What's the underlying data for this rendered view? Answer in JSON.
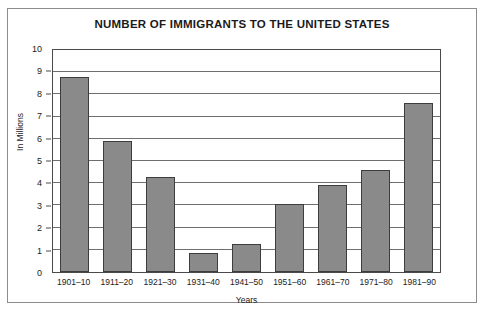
{
  "chart_data": {
    "type": "bar",
    "title": "NUMBER OF IMMIGRANTS TO THE UNITED STATES",
    "xlabel": "Years",
    "ylabel": "In Millions",
    "categories": [
      "1901–10",
      "1911–20",
      "1921–30",
      "1931–40",
      "1941–50",
      "1951–60",
      "1961–70",
      "1971–80",
      "1981–90"
    ],
    "values": [
      8.8,
      5.9,
      4.3,
      0.85,
      1.25,
      3.05,
      3.9,
      4.6,
      7.6
    ],
    "ylim": [
      0,
      10
    ],
    "ytick_labels": [
      "10",
      "9",
      "8",
      "7",
      "6",
      "5",
      "4",
      "3",
      "2",
      "1",
      "0"
    ],
    "ytick_values": [
      10,
      9,
      8,
      7,
      6,
      5,
      4,
      3,
      2,
      1,
      0
    ],
    "grid": true,
    "legend": null,
    "bar_color": "#8a8a8a",
    "bar_border_color": "#3d3d3d",
    "grid_color": "#6f6f6f",
    "axis_color": "#4a4a4a",
    "text_color": "#1b1b1b",
    "frame_color": "#8d8d8d",
    "background": "#ffffff"
  }
}
